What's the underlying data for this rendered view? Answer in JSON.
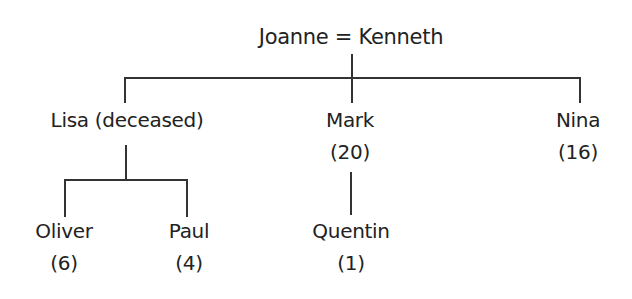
{
  "diagram": {
    "type": "family-tree",
    "root": {
      "label": "Joanne = Kenneth"
    },
    "children": [
      {
        "name": "Lisa (deceased)",
        "age": "",
        "children": [
          {
            "name": "Oliver",
            "age": "(6)"
          },
          {
            "name": "Paul",
            "age": "(4)"
          }
        ]
      },
      {
        "name": "Mark",
        "age": "(20)",
        "children": [
          {
            "name": "Quentin",
            "age": "(1)"
          }
        ]
      },
      {
        "name": "Nina",
        "age": "(16)"
      }
    ]
  }
}
